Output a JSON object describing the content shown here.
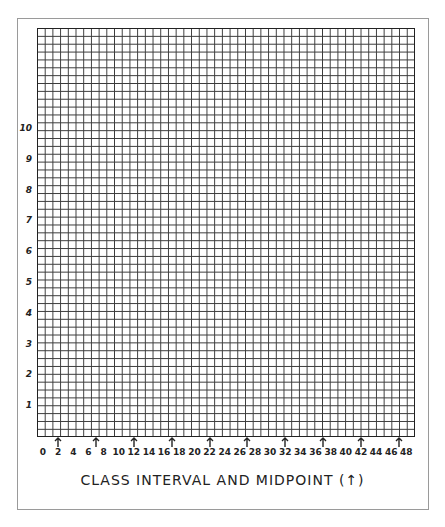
{
  "chart_data": {
    "type": "bar",
    "title": "",
    "xlabel": "CLASS INTERVAL AND MIDPOINT (↑)",
    "ylabel": "",
    "xlim": [
      0,
      49
    ],
    "ylim": [
      0,
      13
    ],
    "grid": true,
    "x_ticks": [
      0,
      2,
      4,
      6,
      8,
      10,
      12,
      14,
      16,
      18,
      20,
      22,
      24,
      26,
      28,
      30,
      32,
      34,
      36,
      38,
      40,
      42,
      44,
      46,
      48
    ],
    "y_ticks": [
      1,
      2,
      3,
      4,
      5,
      6,
      7,
      8,
      9,
      10
    ],
    "midpoint_arrows": [
      2,
      7,
      12,
      17,
      22,
      27,
      32,
      37,
      42,
      47
    ],
    "categories": [],
    "values": [],
    "note": "Blank graph-paper histogram template; no data plotted"
  },
  "labels": {
    "x_title": "CLASS INTERVAL AND MIDPOINT (↑)",
    "x_ticks": [
      "0",
      "2",
      "4",
      "6",
      "8",
      "10",
      "12",
      "14",
      "16",
      "18",
      "20",
      "22",
      "24",
      "26",
      "28",
      "30",
      "32",
      "34",
      "36",
      "38",
      "40",
      "42",
      "44",
      "46",
      "48"
    ],
    "y_ticks": [
      "1",
      "2",
      "3",
      "4",
      "5",
      "6",
      "7",
      "8",
      "9",
      "10"
    ]
  },
  "colors": {
    "grid_line": "#3a3a3a",
    "frame": "#9a9a9a",
    "text": "#222222"
  }
}
